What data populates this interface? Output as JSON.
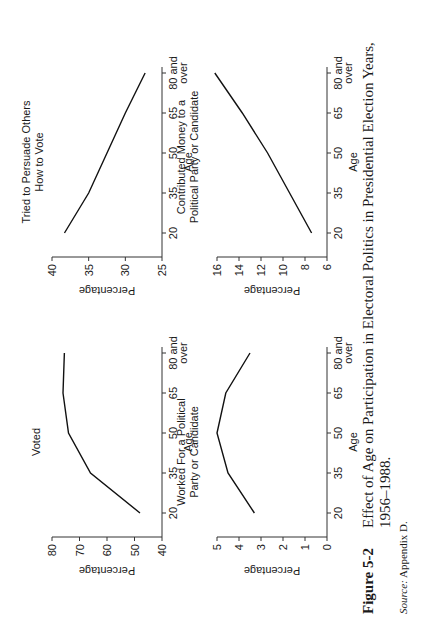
{
  "figure": {
    "label": "Figure 5-2",
    "title_line1": "Effect of Age on Participation in Electoral Politics in Presidential Election Years,",
    "title_line2": "1956–1988.",
    "source_label": "Source:",
    "source_text": "Appendix D."
  },
  "panels": [
    {
      "title_lines": [
        "Voted"
      ]
    },
    {
      "title_lines": [
        "Tried to Persuade Others",
        "How to Vote"
      ]
    },
    {
      "title_lines": [
        "Worked For a Political",
        "Party or Candidate"
      ]
    },
    {
      "title_lines": [
        "Contributed Money to a",
        "Political Party or Candidate"
      ]
    }
  ],
  "chart_data": [
    {
      "type": "line",
      "title": "Voted",
      "xlabel": "Age",
      "ylabel": "Percentage",
      "categories": [
        "20",
        "35",
        "50",
        "65",
        "80 and over"
      ],
      "values": [
        48,
        66,
        74,
        76,
        75.5
      ],
      "ylim": [
        40,
        80
      ],
      "yticks": [
        40,
        50,
        60,
        70,
        80
      ],
      "grid": false
    },
    {
      "type": "line",
      "title": "Tried to Persuade Others How to Vote",
      "xlabel": "Age",
      "ylabel": "Percentage",
      "categories": [
        "20",
        "35",
        "50",
        "65",
        "80 and over"
      ],
      "values": [
        38.3,
        35,
        32.5,
        30,
        27.3
      ],
      "ylim": [
        25,
        40
      ],
      "yticks": [
        25,
        30,
        35,
        40
      ],
      "grid": false
    },
    {
      "type": "line",
      "title": "Worked For a Political Party or Candidate",
      "xlabel": "Age",
      "ylabel": "Percentage",
      "categories": [
        "20",
        "35",
        "50",
        "65",
        "80 and over"
      ],
      "values": [
        3.3,
        4.5,
        5.0,
        4.6,
        3.5
      ],
      "ylim": [
        0,
        5
      ],
      "yticks": [
        0,
        1,
        2,
        3,
        4,
        5
      ],
      "grid": false
    },
    {
      "type": "line",
      "title": "Contributed Money to a Political Party or Candidate",
      "xlabel": "Age",
      "ylabel": "Percentage",
      "categories": [
        "20",
        "35",
        "50",
        "65",
        "80 and over"
      ],
      "values": [
        7.4,
        9.4,
        11.4,
        13.7,
        16.2
      ],
      "ylim": [
        6,
        16
      ],
      "yticks": [
        6,
        8,
        10,
        12,
        14,
        16
      ],
      "grid": false
    }
  ]
}
